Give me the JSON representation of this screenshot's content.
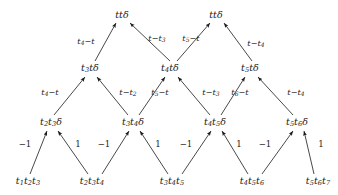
{
  "diagram": {
    "type": "triangular-recurrence-tree",
    "levels": 4,
    "stroke_color": "#1a1a1a",
    "background_color": "#ffffff",
    "rows": [
      {
        "name": "row-top",
        "y": 14,
        "nodes": [
          {
            "id": "n3-0",
            "x": 122,
            "label": "ttd",
            "text_parts": [
              {
                "t": "t"
              },
              {
                "t": "t"
              },
              {
                "t": "δ"
              }
            ]
          },
          {
            "id": "n3-1",
            "x": 216,
            "label": "ttd",
            "text_parts": [
              {
                "t": "t"
              },
              {
                "t": "t"
              },
              {
                "t": "δ"
              }
            ]
          }
        ]
      },
      {
        "name": "row-third",
        "y": 68,
        "nodes": [
          {
            "id": "n2-0",
            "x": 90,
            "label": "t3 t d",
            "text_parts": [
              {
                "t": "t",
                "sub": "3"
              },
              {
                "t": "t"
              },
              {
                "t": "δ"
              }
            ]
          },
          {
            "id": "n2-1",
            "x": 170,
            "label": "t4 t d",
            "text_parts": [
              {
                "t": "t",
                "sub": "4"
              },
              {
                "t": "t"
              },
              {
                "t": "δ"
              }
            ]
          },
          {
            "id": "n2-2",
            "x": 250,
            "label": "t5 t d",
            "text_parts": [
              {
                "t": "t",
                "sub": "5"
              },
              {
                "t": "t"
              },
              {
                "t": "δ"
              }
            ]
          }
        ]
      },
      {
        "name": "row-second",
        "y": 122,
        "nodes": [
          {
            "id": "n1-0",
            "x": 51,
            "label": "t2 t3 d",
            "text_parts": [
              {
                "t": "t",
                "sub": "2"
              },
              {
                "t": "t",
                "sub": "3"
              },
              {
                "t": "δ"
              }
            ]
          },
          {
            "id": "n1-1",
            "x": 133,
            "label": "t3 t4 d",
            "text_parts": [
              {
                "t": "t",
                "sub": "3"
              },
              {
                "t": "t",
                "sub": "4"
              },
              {
                "t": "δ"
              }
            ]
          },
          {
            "id": "n1-2",
            "x": 215,
            "label": "t4 t5 d",
            "text_parts": [
              {
                "t": "t",
                "sub": "4"
              },
              {
                "t": "t",
                "sub": "5"
              },
              {
                "t": "δ"
              }
            ]
          },
          {
            "id": "n1-3",
            "x": 297,
            "label": "t5 t6 d",
            "text_parts": [
              {
                "t": "t",
                "sub": "5"
              },
              {
                "t": "t",
                "sub": "6"
              },
              {
                "t": "δ"
              }
            ]
          }
        ]
      },
      {
        "name": "row-bottom",
        "y": 181,
        "nodes": [
          {
            "id": "n0-0",
            "x": 28,
            "label": "t1 t2 t3",
            "text_parts": [
              {
                "t": "t",
                "sub": "1"
              },
              {
                "t": "t",
                "sub": "2"
              },
              {
                "t": "t",
                "sub": "3"
              }
            ]
          },
          {
            "id": "n0-1",
            "x": 92,
            "label": "t2 t3 t4",
            "text_parts": [
              {
                "t": "t",
                "sub": "2"
              },
              {
                "t": "t",
                "sub": "3"
              },
              {
                "t": "t",
                "sub": "4"
              }
            ]
          },
          {
            "id": "n0-2",
            "x": 172,
            "label": "t3 t4 t5",
            "text_parts": [
              {
                "t": "t",
                "sub": "3"
              },
              {
                "t": "t",
                "sub": "4"
              },
              {
                "t": "t",
                "sub": "5"
              }
            ]
          },
          {
            "id": "n0-3",
            "x": 252,
            "label": "t4 t5 t6",
            "text_parts": [
              {
                "t": "t",
                "sub": "4"
              },
              {
                "t": "t",
                "sub": "5"
              },
              {
                "t": "t",
                "sub": "6"
              }
            ]
          },
          {
            "id": "n0-4",
            "x": 318,
            "label": "t5 t6 t7",
            "text_parts": [
              {
                "t": "t",
                "sub": "5"
              },
              {
                "t": "t",
                "sub": "6"
              },
              {
                "t": "t",
                "sub": "7"
              }
            ]
          }
        ]
      }
    ],
    "edges": [
      {
        "id": "e0",
        "from": "n0-0",
        "to": "n1-0",
        "x1": 30,
        "y1": 174,
        "x2": 47,
        "y2": 131,
        "label": "-1",
        "label_x": 25,
        "label_y": 144,
        "plain": true
      },
      {
        "id": "e1",
        "from": "n0-1",
        "to": "n1-0",
        "x1": 88,
        "y1": 174,
        "x2": 58,
        "y2": 131,
        "label": "1",
        "label_x": 78,
        "label_y": 144,
        "plain": true
      },
      {
        "id": "e2",
        "from": "n0-1",
        "to": "n1-1",
        "x1": 102,
        "y1": 174,
        "x2": 129,
        "y2": 131,
        "label": "-1",
        "label_x": 104,
        "label_y": 144,
        "plain": true
      },
      {
        "id": "e3",
        "from": "n0-2",
        "to": "n1-1",
        "x1": 168,
        "y1": 174,
        "x2": 140,
        "y2": 131,
        "label": "1",
        "label_x": 158,
        "label_y": 144,
        "plain": true
      },
      {
        "id": "e4",
        "from": "n0-2",
        "to": "n1-2",
        "x1": 182,
        "y1": 174,
        "x2": 211,
        "y2": 131,
        "label": "-1",
        "label_x": 186,
        "label_y": 144,
        "plain": true
      },
      {
        "id": "e5",
        "from": "n0-3",
        "to": "n1-2",
        "x1": 248,
        "y1": 174,
        "x2": 222,
        "y2": 131,
        "label": "1",
        "label_x": 239,
        "label_y": 144,
        "plain": true
      },
      {
        "id": "e6",
        "from": "n0-3",
        "to": "n1-3",
        "x1": 262,
        "y1": 174,
        "x2": 293,
        "y2": 131,
        "label": "-1",
        "label_x": 265,
        "label_y": 144,
        "plain": true
      },
      {
        "id": "e7",
        "from": "n0-4",
        "to": "n1-3",
        "x1": 314,
        "y1": 174,
        "x2": 304,
        "y2": 131,
        "label": "1",
        "label_x": 321,
        "label_y": 144,
        "plain": true
      },
      {
        "id": "e8",
        "from": "n1-0",
        "to": "n2-0",
        "x1": 54,
        "y1": 115,
        "x2": 85,
        "y2": 77,
        "label": "t4-t",
        "label_x": 50,
        "label_y": 92
      },
      {
        "id": "e9",
        "from": "n1-1",
        "to": "n2-0",
        "x1": 128,
        "y1": 115,
        "x2": 97,
        "y2": 77,
        "label": "t-t2",
        "label_x": 128,
        "label_y": 92
      },
      {
        "id": "e10",
        "from": "n1-1",
        "to": "n2-1",
        "x1": 139,
        "y1": 115,
        "x2": 165,
        "y2": 77,
        "label": "t5-t",
        "label_x": 160,
        "label_y": 92
      },
      {
        "id": "e11",
        "from": "n1-2",
        "to": "n2-1",
        "x1": 210,
        "y1": 115,
        "x2": 178,
        "y2": 77,
        "label": "t-t3",
        "label_x": 211,
        "label_y": 92
      },
      {
        "id": "e12",
        "from": "n1-2",
        "to": "n2-2",
        "x1": 221,
        "y1": 115,
        "x2": 245,
        "y2": 77,
        "label": "t6-t",
        "label_x": 240,
        "label_y": 92
      },
      {
        "id": "e13",
        "from": "n1-3",
        "to": "n2-2",
        "x1": 293,
        "y1": 115,
        "x2": 258,
        "y2": 77,
        "label": "t-t4",
        "label_x": 296,
        "label_y": 92
      },
      {
        "id": "e14",
        "from": "n2-0",
        "to": "n3-0",
        "x1": 95,
        "y1": 61,
        "x2": 116,
        "y2": 23,
        "label": "t4-t",
        "label_x": 86,
        "label_y": 41
      },
      {
        "id": "e15",
        "from": "n2-1",
        "to": "n3-0",
        "x1": 170,
        "y1": 61,
        "x2": 130,
        "y2": 23,
        "label": "t-t3",
        "label_x": 157,
        "label_y": 38
      },
      {
        "id": "e16",
        "from": "n2-1",
        "to": "n3-1",
        "x1": 177,
        "y1": 61,
        "x2": 210,
        "y2": 23,
        "label": "t5-t",
        "label_x": 191,
        "label_y": 38
      },
      {
        "id": "e17",
        "from": "n2-2",
        "to": "n3-1",
        "x1": 252,
        "y1": 61,
        "x2": 224,
        "y2": 23,
        "label": "t-t4",
        "label_x": 256,
        "label_y": 43
      }
    ],
    "edge_labels": {
      "minus_one": "−1",
      "one": "1"
    }
  }
}
